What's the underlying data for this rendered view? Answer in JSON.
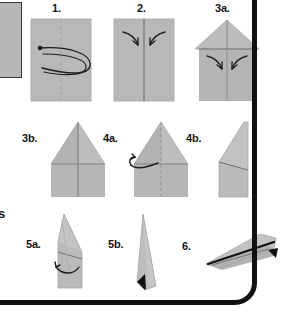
{
  "diagram": {
    "background_color": "#ffffff",
    "paper_color": "#b8b8b8",
    "paper_shade_color": "#a8a8a8",
    "paper_highlight_color": "#c9c9c9",
    "line_color": "#6b6b6b",
    "ink_color": "#141414",
    "frame_color": "#111111"
  },
  "margin": {
    "left_box_label": "",
    "cut_glyph": "s"
  },
  "steps": [
    {
      "id": "step-1",
      "label": "1.",
      "shape": "rectangle",
      "crease": "vertical-dashed-center",
      "arrow": "loop-fold-in-half-arrow",
      "description": "Fold the sheet in half lengthwise and unfold"
    },
    {
      "id": "step-2",
      "label": "2.",
      "shape": "rectangle",
      "crease": "vertical-solid-center",
      "arrow": "two-inward-corner-arrows",
      "description": "Fold both top corners in to the center line"
    },
    {
      "id": "step-3a",
      "label": "3a.",
      "shape": "house-pentagon",
      "crease": "vertical-center",
      "arrow": "two-inward-arrows",
      "description": "Fold the angled edges in to the center line again"
    },
    {
      "id": "step-3b",
      "label": "3b.",
      "shape": "dart",
      "crease": "vertical-center",
      "arrow": "none",
      "description": "Result after folding: the dart shape"
    },
    {
      "id": "step-4a",
      "label": "4a.",
      "shape": "dart",
      "crease": "vertical-dashed-center",
      "arrow": "curved-left-fold-arrow",
      "description": "Fold the whole model in half along the center crease"
    },
    {
      "id": "step-4b",
      "label": "4b.",
      "shape": "half-profile-triangle",
      "crease": "diagonal-fold-line",
      "arrow": "none",
      "description": "Folded in half, seen from the side"
    },
    {
      "id": "step-5a",
      "label": "5a.",
      "shape": "narrow-profile-triangle",
      "crease": "diagonal-wing-line",
      "arrow": "curved-wing-fold-arrow",
      "description": "Fold the wings down on both sides"
    },
    {
      "id": "step-5b",
      "label": "5b.",
      "shape": "slim-triangle",
      "crease": "wing-edge",
      "arrow": "none",
      "accent": "black-tail-triangle",
      "description": "Both wings folded down"
    },
    {
      "id": "step-6",
      "label": "6.",
      "shape": "finished-paper-airplane",
      "crease": "body-keel-line",
      "arrow": "none",
      "accent": "black-tail-triangle",
      "description": "The finished paper airplane"
    }
  ]
}
